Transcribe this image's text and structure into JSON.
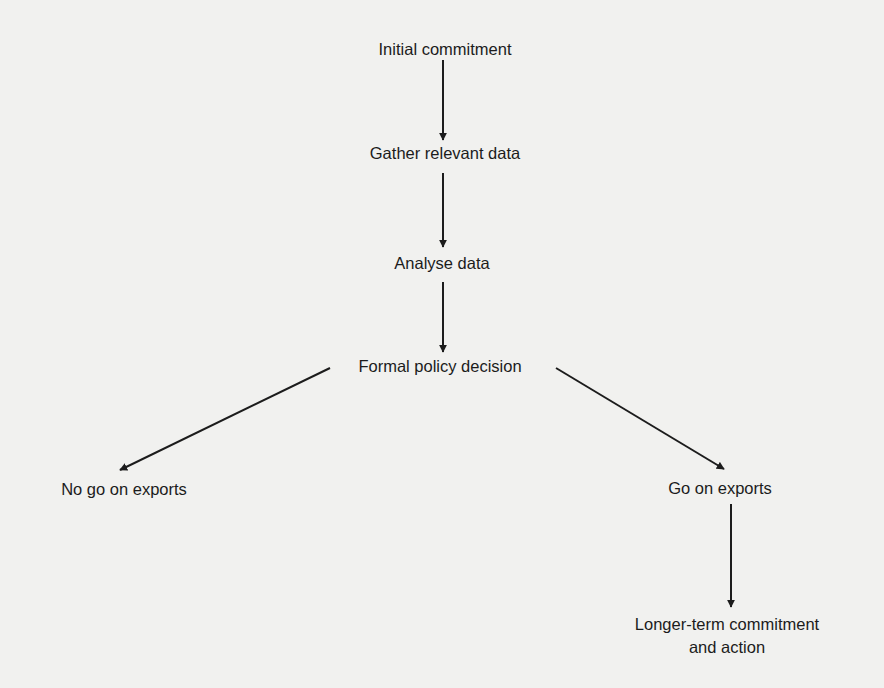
{
  "diagram": {
    "type": "flowchart",
    "nodes": {
      "initial": "Initial commitment",
      "gather": "Gather relevant data",
      "analyse": "Analyse data",
      "decision": "Formal policy decision",
      "no_go": "No go on exports",
      "go": "Go on exports",
      "longer_term_line1": "Longer-term commitment",
      "longer_term_line2": "and action"
    },
    "edges": [
      {
        "from": "Initial commitment",
        "to": "Gather relevant data"
      },
      {
        "from": "Gather relevant data",
        "to": "Analyse data"
      },
      {
        "from": "Analyse data",
        "to": "Formal policy decision"
      },
      {
        "from": "Formal policy decision",
        "to": "No go on exports"
      },
      {
        "from": "Formal policy decision",
        "to": "Go on exports"
      },
      {
        "from": "Go on exports",
        "to": "Longer-term commitment and action"
      }
    ],
    "colors": {
      "background": "#f1f1ef",
      "ink": "#1c1c1c"
    }
  }
}
